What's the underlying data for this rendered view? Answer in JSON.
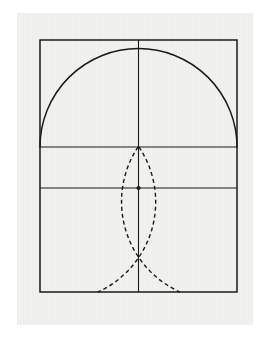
{
  "document": {
    "title": "Geometric construction figure",
    "kind": "line-drawing",
    "caption_text": ""
  },
  "canvas": {
    "width": 269,
    "height": 345,
    "page_background": "#ffffff"
  },
  "scan": {
    "x": 17,
    "y": 13,
    "width": 236,
    "height": 312,
    "paper_color": "#f1f1ef",
    "texture": "vertical-scanlines"
  },
  "style": {
    "ink_color": "#1a1a1a",
    "solid_stroke_width": 1.5,
    "thin_stroke_width": 1.1,
    "dashed_stroke_width": 1.4,
    "dash_pattern": "4,3"
  },
  "geometry": {
    "rectangle": {
      "label": "outer-rectangle",
      "left": 40,
      "top": 40,
      "right": 237,
      "bottom": 292,
      "width": 197,
      "height": 252
    },
    "vertical_axis": {
      "label": "vertical-center-line",
      "x": 138.5,
      "y_top": 40,
      "y_bottom": 292
    },
    "horizontal_upper": {
      "label": "diameter-line",
      "y": 147,
      "x_left": 40,
      "x_right": 237
    },
    "horizontal_lower": {
      "label": "lower-horizontal-line",
      "y": 188,
      "x_left": 40,
      "x_right": 237
    },
    "semicircle": {
      "label": "upper-solid-semicircle",
      "center_x": 138.5,
      "center_y": 147,
      "radius": 98.5,
      "start_angle_deg": 180,
      "end_angle_deg": 360,
      "style": "solid"
    },
    "arc_left": {
      "label": "dashed-arc-centered-left",
      "center_x": 40,
      "center_y": 147,
      "radius": 99,
      "from_x": 139,
      "from_y": 147,
      "to_x": 98,
      "to_y": 292,
      "style": "dashed"
    },
    "arc_right": {
      "label": "dashed-arc-centered-right",
      "center_x": 237,
      "center_y": 147,
      "radius": 99,
      "from_x": 138,
      "from_y": 147,
      "to_x": 180,
      "to_y": 292,
      "style": "dashed"
    },
    "crossing_point": {
      "label": "arcs-intersection",
      "x": 138.5,
      "y": 188
    }
  }
}
